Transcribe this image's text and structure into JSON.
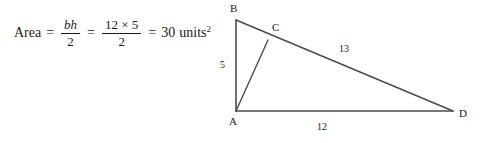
{
  "page": {
    "background_color": "#ffffff",
    "ink_color": "#1a1a1a"
  },
  "formula": {
    "area_word": "Area",
    "equals_1": "=",
    "frac1": {
      "numerator": "bh",
      "denominator": "2"
    },
    "equals_2": "=",
    "frac2": {
      "numerator": "12 × 5",
      "denominator": "2"
    },
    "equals_3": "=",
    "result_value": "30",
    "result_unit": "units",
    "result_exponent": "2"
  },
  "diagram": {
    "type": "geometry-figure",
    "shape": "right triangle with cevian",
    "stroke_color": "#4a4a52",
    "vertices": [
      {
        "id": "B",
        "label": "B",
        "x": 30,
        "y": 20
      },
      {
        "id": "C",
        "label": "C",
        "x": 62,
        "y": 40
      },
      {
        "id": "A",
        "label": "A",
        "x": 30,
        "y": 111
      },
      {
        "id": "D",
        "label": "D",
        "x": 247,
        "y": 111
      }
    ],
    "segments": [
      {
        "name": "BA",
        "from": "B",
        "to": "A"
      },
      {
        "name": "AD",
        "from": "A",
        "to": "D"
      },
      {
        "name": "BD",
        "from": "B",
        "to": "D"
      },
      {
        "name": "AC",
        "from": "A",
        "to": "C"
      }
    ],
    "measurements": [
      {
        "name": "height-BA",
        "value": "5"
      },
      {
        "name": "base-AD",
        "value": "12"
      },
      {
        "name": "hypotenuse-BD",
        "value": "13"
      }
    ]
  }
}
